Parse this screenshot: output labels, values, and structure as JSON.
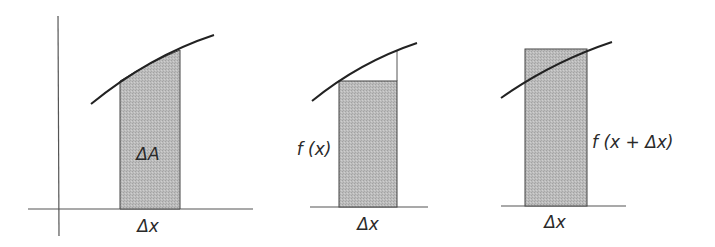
{
  "colors": {
    "ink": "#333333",
    "axis": "#555555",
    "fill": "#b9b9b9",
    "fill_stipple": "#a6a6a6",
    "background": "#ffffff"
  },
  "panels": [
    {
      "id": "exact-area",
      "description": "Area strip under curve between x and x + Δx",
      "area_label": "ΔA",
      "width_label": "Δx",
      "has_axes": true
    },
    {
      "id": "lower-rectangle",
      "description": "Inscribed rectangle of height f(x)",
      "height_label": "f (x)",
      "width_label": "Δx",
      "has_axes": false
    },
    {
      "id": "upper-rectangle",
      "description": "Circumscribed rectangle of height f(x + Δx)",
      "height_label": "f (x + Δx)",
      "width_label": "Δx",
      "has_axes": false
    }
  ]
}
